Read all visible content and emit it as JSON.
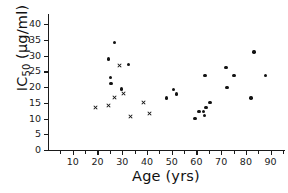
{
  "chart_data": {
    "type": "scatter",
    "title": "",
    "xlabel": "Age (yrs)",
    "ylabel": "IC50 (µg/ml)",
    "ylabel_base": "IC",
    "ylabel_sub": "50",
    "ylabel_units": " (µg/ml)",
    "xlim": [
      0,
      95
    ],
    "ylim": [
      0,
      42
    ],
    "grid": false,
    "legend": "none",
    "xticks": [
      10,
      20,
      30,
      40,
      50,
      60,
      70,
      80,
      90
    ],
    "xtick_labels": [
      "10",
      "20",
      "30",
      "40",
      "50",
      "60",
      "70",
      "80",
      "90"
    ],
    "xminor_step": 5,
    "yticks": [
      0,
      5,
      10,
      15,
      20,
      25,
      30,
      35,
      40
    ],
    "ytick_labels": [
      "0",
      "5",
      "10",
      "15",
      "20",
      "25",
      "30",
      "35",
      "40"
    ],
    "marker_colors": {
      "circle": "#121212",
      "cross": "#121212"
    },
    "series": [
      {
        "name": "circle-markers",
        "marker": "circle",
        "points": [
          {
            "x": 24.5,
            "y": 29.0
          },
          {
            "x": 26.8,
            "y": 34.3
          },
          {
            "x": 25.3,
            "y": 23.0
          },
          {
            "x": 25.4,
            "y": 21.2
          },
          {
            "x": 32.6,
            "y": 27.2
          },
          {
            "x": 29.8,
            "y": 19.4
          },
          {
            "x": 48.0,
            "y": 16.5
          },
          {
            "x": 50.8,
            "y": 19.3
          },
          {
            "x": 52.0,
            "y": 17.8
          },
          {
            "x": 59.5,
            "y": 10.0
          },
          {
            "x": 61.0,
            "y": 12.2
          },
          {
            "x": 62.8,
            "y": 12.3
          },
          {
            "x": 63.8,
            "y": 13.5
          },
          {
            "x": 63.3,
            "y": 10.9
          },
          {
            "x": 65.5,
            "y": 15.2
          },
          {
            "x": 63.5,
            "y": 23.8
          },
          {
            "x": 72.0,
            "y": 26.3
          },
          {
            "x": 72.3,
            "y": 19.8
          },
          {
            "x": 75.2,
            "y": 23.8
          },
          {
            "x": 82.0,
            "y": 16.6
          },
          {
            "x": 83.3,
            "y": 31.2
          },
          {
            "x": 88.0,
            "y": 23.7
          }
        ]
      },
      {
        "name": "cross-markers",
        "marker": "cross",
        "points": [
          {
            "x": 19.2,
            "y": 13.6
          },
          {
            "x": 24.6,
            "y": 14.3
          },
          {
            "x": 26.8,
            "y": 16.8
          },
          {
            "x": 28.8,
            "y": 27.0
          },
          {
            "x": 30.5,
            "y": 18.1
          },
          {
            "x": 33.2,
            "y": 10.7
          },
          {
            "x": 38.6,
            "y": 15.0
          },
          {
            "x": 41.0,
            "y": 11.5
          }
        ]
      }
    ]
  },
  "plot_geometry": {
    "left_px": 48,
    "right_px": 283,
    "bottom_px": 150,
    "top_px": 18
  }
}
